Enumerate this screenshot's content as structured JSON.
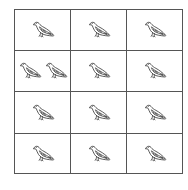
{
  "grid": {
    "rows": 4,
    "columns": 3,
    "line_color": "#555555",
    "background": "#ffffff",
    "cells": [
      {
        "row": 0,
        "col": 0,
        "pigeons": 1
      },
      {
        "row": 0,
        "col": 1,
        "pigeons": 1
      },
      {
        "row": 0,
        "col": 2,
        "pigeons": 1
      },
      {
        "row": 1,
        "col": 0,
        "pigeons": 2
      },
      {
        "row": 1,
        "col": 1,
        "pigeons": 1
      },
      {
        "row": 1,
        "col": 2,
        "pigeons": 1
      },
      {
        "row": 2,
        "col": 0,
        "pigeons": 1
      },
      {
        "row": 2,
        "col": 1,
        "pigeons": 1
      },
      {
        "row": 2,
        "col": 2,
        "pigeons": 1
      },
      {
        "row": 3,
        "col": 0,
        "pigeons": 1
      },
      {
        "row": 3,
        "col": 1,
        "pigeons": 1
      },
      {
        "row": 3,
        "col": 2,
        "pigeons": 1
      }
    ]
  },
  "icon": {
    "name": "pigeon-icon",
    "stroke": "#333333",
    "fill": "#ffffff",
    "wing_mark": "#555555"
  }
}
